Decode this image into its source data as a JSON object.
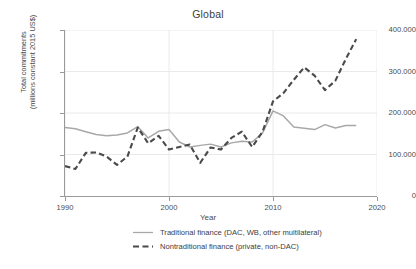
{
  "chart_data": {
    "type": "line",
    "title": "Global",
    "xlabel": "Year",
    "ylabel_line1": "Total commitments",
    "ylabel_line2": "(millions constant 2015 US$)",
    "xlim": [
      1990,
      2020
    ],
    "ylim": [
      0,
      400000
    ],
    "xticks": [
      1990,
      2000,
      2010,
      2020
    ],
    "xtick_labels": [
      "1990",
      "2000",
      "2010",
      "2020"
    ],
    "yticks": [
      0,
      100000,
      200000,
      300000,
      400000
    ],
    "ytick_labels": [
      "0",
      "100.000",
      "200.000",
      "300.000",
      "400.000"
    ],
    "grid": true,
    "legend_position": "bottom",
    "x": [
      1990,
      1991,
      1992,
      1993,
      1994,
      1995,
      1996,
      1997,
      1998,
      1999,
      2000,
      2001,
      2002,
      2003,
      2004,
      2005,
      2006,
      2007,
      2008,
      2009,
      2010,
      2011,
      2012,
      2013,
      2014,
      2015,
      2016,
      2017,
      2018
    ],
    "series": [
      {
        "name": "Traditional finance (DAC, WB, other multilateral)",
        "style": "solid",
        "color": "#a8a8a8",
        "values": [
          165000,
          162000,
          155000,
          148000,
          145000,
          147000,
          152000,
          167000,
          140000,
          156000,
          160000,
          130000,
          118000,
          122000,
          125000,
          118000,
          128000,
          132000,
          130000,
          152000,
          205000,
          193000,
          166000,
          163000,
          160000,
          172000,
          164000,
          170000,
          170000
        ]
      },
      {
        "name": "Nontraditional finance (private, non-DAC)",
        "style": "dashed",
        "color": "#4a4a4a",
        "values": [
          72000,
          65000,
          104000,
          105000,
          95000,
          75000,
          95000,
          165000,
          127000,
          145000,
          112000,
          118000,
          124000,
          80000,
          117000,
          112000,
          140000,
          155000,
          118000,
          155000,
          228000,
          248000,
          280000,
          310000,
          290000,
          255000,
          278000,
          330000,
          378000
        ]
      }
    ]
  }
}
